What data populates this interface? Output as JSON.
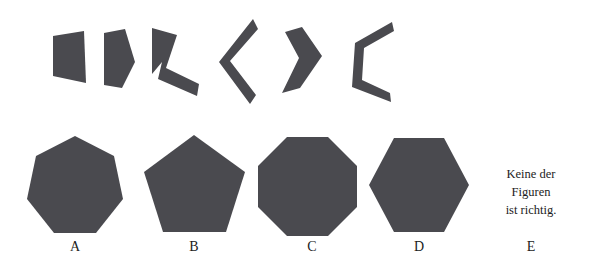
{
  "page": {
    "width": 592,
    "height": 267,
    "background_color": "#ffffff",
    "shape_fill_color": "#4a4a4f",
    "text_color": "#1c1c1c",
    "kind": "visual-reasoning-figure-assembly-item"
  },
  "pieces": {
    "count": 6,
    "description": "Row of six dark gray flat puzzle fragments to be mentally assembled",
    "items": [
      {
        "id": "piece-1",
        "shape": "quadrilateral-trapezoid"
      },
      {
        "id": "piece-2",
        "shape": "pentagon-wedge"
      },
      {
        "id": "piece-3",
        "shape": "bent-L-strip"
      },
      {
        "id": "piece-4",
        "shape": "thin-chevron-left"
      },
      {
        "id": "piece-5",
        "shape": "thick-chevron-right"
      },
      {
        "id": "piece-6",
        "shape": "open-bracket-C"
      }
    ]
  },
  "options": {
    "items": [
      {
        "key": "A",
        "label": "A",
        "shape": "heptagon",
        "sides": 7
      },
      {
        "key": "B",
        "label": "B",
        "shape": "pentagon",
        "sides": 5
      },
      {
        "key": "C",
        "label": "C",
        "shape": "octagon",
        "sides": 8
      },
      {
        "key": "D",
        "label": "D",
        "shape": "hexagon",
        "sides": 6
      },
      {
        "key": "E",
        "label": "E",
        "shape": "text-none-of-the-figures",
        "sides": 0
      }
    ],
    "e_text_lines": [
      "Keine der",
      "Figuren",
      "ist richtig."
    ]
  }
}
